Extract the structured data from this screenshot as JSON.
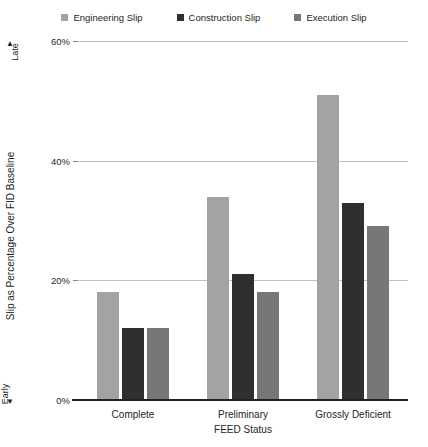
{
  "chart_data": {
    "type": "bar",
    "title": "",
    "categories": [
      "Complete",
      "Preliminary",
      "Grossly Deficient"
    ],
    "series": [
      {
        "name": "Engineering Slip",
        "color": "#a3a3a3",
        "values": [
          18,
          34,
          51
        ]
      },
      {
        "name": "Construction Slip",
        "color": "#2f2f2f",
        "values": [
          12,
          21,
          33
        ]
      },
      {
        "name": "Execution Slip",
        "color": "#777777",
        "values": [
          12,
          18,
          29
        ]
      }
    ],
    "xlabel": "FEED Status",
    "ylabel": "Slip as Percentage Over FID Baseline",
    "ylim": [
      0,
      60
    ],
    "yticks": [
      0,
      20,
      40,
      60
    ],
    "ytick_labels": [
      "0%",
      "20%",
      "40%",
      "60%"
    ],
    "grid": true,
    "legend_position": "top",
    "annotations": {
      "axis_top_label": "Late",
      "axis_top_arrow": "▲",
      "axis_bottom_label": "Early",
      "axis_bottom_arrow": "▼"
    }
  },
  "legend": {
    "items": [
      {
        "label": "Engineering Slip",
        "swatch_color": "#a3a3a3",
        "icon": "square-swatch-icon"
      },
      {
        "label": "Construction Slip",
        "swatch_color": "#2f2f2f",
        "icon": "square-swatch-icon"
      },
      {
        "label": "Execution Slip",
        "swatch_color": "#777777",
        "icon": "square-swatch-icon"
      }
    ]
  },
  "axes": {
    "y_title": "Slip as Percentage Over FID Baseline",
    "y_top_label": "Late",
    "y_top_arrow": "▲",
    "y_bottom_label": "Early",
    "y_bottom_arrow": "▼",
    "x_title": "FEED Status",
    "y_tick_labels": [
      "60%",
      "40%",
      "20%",
      "0%"
    ],
    "x_tick_labels": [
      "Complete",
      "Preliminary",
      "Grossly Deficient"
    ]
  }
}
